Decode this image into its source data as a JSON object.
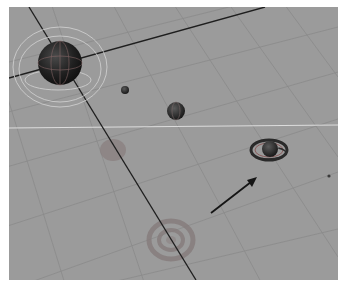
{
  "viewport": {
    "type": "3d-perspective-view",
    "background_color": "#9b9b9b",
    "grid_color": "#888888",
    "axis_color": "#1e1e1e",
    "horizon_line_color": "#d8d8d8"
  },
  "objects": [
    {
      "name": "large-sphere",
      "kind": "sphere",
      "selected": true,
      "color": "#1c1c1c"
    },
    {
      "name": "tiny-sphere",
      "kind": "sphere",
      "color": "#2e2e2e"
    },
    {
      "name": "medium-sphere",
      "kind": "sphere",
      "color": "#262626"
    },
    {
      "name": "ringed-planet",
      "kind": "sphere-with-rings",
      "color": "#2a2a2a"
    },
    {
      "name": "small-dot",
      "kind": "point",
      "color": "#3a3a3a"
    }
  ],
  "shadows": [
    {
      "name": "sphere-shadow",
      "kind": "disc"
    },
    {
      "name": "ring-shadow",
      "kind": "concentric-rings"
    }
  ],
  "annotation": {
    "kind": "arrow",
    "points_to": "ringed-planet",
    "color": "#151515"
  }
}
